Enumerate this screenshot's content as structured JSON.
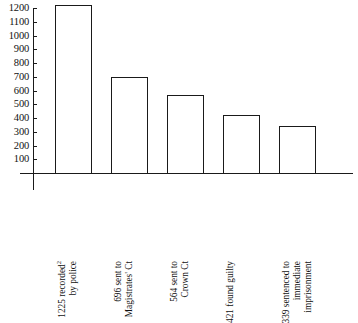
{
  "chart_data": {
    "type": "bar",
    "title": "",
    "subtitle": "",
    "xlabel": "",
    "ylabel": "",
    "ylim": [
      0,
      1200
    ],
    "ytick_step": 100,
    "grid": false,
    "legend": "none",
    "categories": [
      "1225 recorded² by police",
      "696 sent to Magistrates' Ct",
      "564 sent to Crown Ct",
      "421 found guilty",
      "339 sentenced to immediate imprisonment"
    ],
    "values": [
      1225,
      696,
      564,
      421,
      339
    ],
    "ticks": [
      1200,
      1100,
      1000,
      900,
      800,
      700,
      600,
      500,
      400,
      300,
      200,
      100
    ],
    "bars": [
      {
        "value": 1225,
        "label_lines": [
          "1225 recorded",
          "by police"
        ],
        "superscript": "2"
      },
      {
        "value": 696,
        "label_lines": [
          "696 sent to",
          "Magistrates' Ct"
        ],
        "superscript": ""
      },
      {
        "value": 564,
        "label_lines": [
          "564 sent to",
          "Crown Ct"
        ],
        "superscript": ""
      },
      {
        "value": 421,
        "label_lines": [
          "421 found guilty"
        ],
        "superscript": ""
      },
      {
        "value": 339,
        "label_lines": [
          "339 sentenced to",
          "immediate",
          "imprisonment"
        ],
        "superscript": ""
      }
    ],
    "colors": {
      "axis": "#1a1a1a",
      "bar_stroke": "#1a1a1a",
      "bar_fill": "#ffffff",
      "background": "#ffffff",
      "text": "#111111"
    }
  }
}
